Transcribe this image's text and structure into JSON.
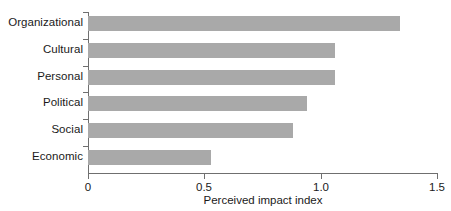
{
  "chart_data": {
    "type": "bar",
    "orientation": "horizontal",
    "title": "",
    "subtitle": "",
    "xlabel": "Perceived impact index",
    "ylabel": "",
    "categories": [
      "Organizational",
      "Cultural",
      "Personal",
      "Political",
      "Social",
      "Economic"
    ],
    "values": [
      1.34,
      1.06,
      1.06,
      0.94,
      0.88,
      0.53
    ],
    "series": [
      {
        "name": "Perceived impact index",
        "values": [
          1.34,
          1.06,
          1.06,
          0.94,
          0.88,
          0.53
        ]
      }
    ],
    "xlim": [
      0,
      1.5
    ],
    "xticks": [
      0,
      0.5,
      1.0,
      1.5
    ],
    "xtick_labels": [
      "0",
      "0.5",
      "1.0",
      "1.5"
    ],
    "grid": false,
    "legend": false,
    "legend_position": "none",
    "bar_color": "#a9a9a9",
    "axis_color": "#6f6f6f",
    "text_color": "#1a1a1a",
    "background": "#ffffff"
  }
}
